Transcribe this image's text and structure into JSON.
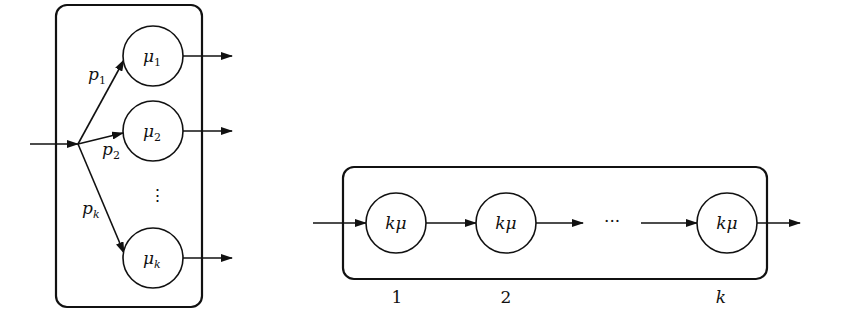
{
  "parallel_model": {
    "branch_labels": [
      {
        "base": "p",
        "sub": "1"
      },
      {
        "base": "p",
        "sub": "2"
      },
      {
        "base": "p",
        "sub": "k"
      }
    ],
    "servers": [
      {
        "base": "μ",
        "sub": "1"
      },
      {
        "base": "μ",
        "sub": "2"
      },
      {
        "base": "μ",
        "sub": "k"
      }
    ],
    "ellipsis": "⋮"
  },
  "series_model": {
    "servers": [
      {
        "label": "kμ",
        "index": "1"
      },
      {
        "label": "kμ",
        "index": "2"
      },
      {
        "label": "kμ",
        "index": "k"
      }
    ],
    "ellipsis": "···"
  },
  "colors": {
    "stroke": "#111111",
    "background": "#ffffff"
  }
}
